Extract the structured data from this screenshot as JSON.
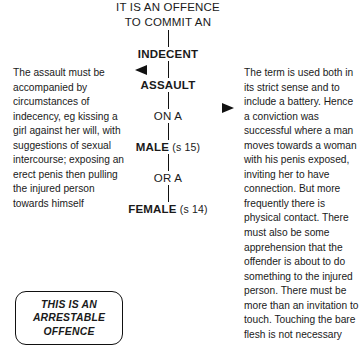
{
  "diagram": {
    "title_lines": [
      "IT IS AN OFFENCE",
      "TO COMMIT AN"
    ],
    "nodes": {
      "indecent": "INDECENT",
      "assault": "ASSAULT",
      "on_a": "ON A",
      "male": "MALE",
      "male_section": " (s 15)",
      "or_a": "OR A",
      "female": "FEMALE",
      "female_section": " (s 14)"
    },
    "left_note": "The assault must be accompanied by circumstances of indecency, eg kissing a girl against her will, with suggestions of sexual intercourse; exposing an erect penis then pulling the injured person towards himself",
    "right_note": "The term is used both in its strict sense and to include a battery. Hence a conviction was successful where a man moves towards a woman with his penis exposed, inviting her to have connection. But more frequently there is physical contact. There must also be some apprehension that the offender is about to do something to the injured person. There must be more than an invitation to touch. Touching the bare flesh is not necessary",
    "arrestable_box_lines": [
      "THIS IS AN",
      "ARRESTABLE",
      "OFFENCE"
    ],
    "icons": {
      "left_arrow": "left-arrowhead-icon",
      "right_arrow": "right-arrowhead-icon"
    },
    "colors": {
      "text": "#1a1a1a",
      "line": "#111111",
      "background": "#ffffff"
    }
  }
}
